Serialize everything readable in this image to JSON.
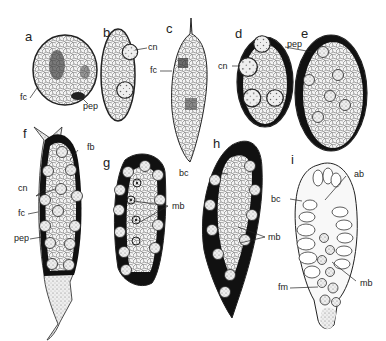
{
  "figure": {
    "panels": [
      {
        "id": "a",
        "label": "a",
        "annotations": [
          {
            "text": "fc"
          },
          {
            "text": "pep"
          }
        ]
      },
      {
        "id": "b",
        "label": "b",
        "annotations": [
          {
            "text": "cn"
          }
        ]
      },
      {
        "id": "c",
        "label": "c",
        "annotations": [
          {
            "text": "fc"
          }
        ]
      },
      {
        "id": "d",
        "label": "d",
        "annotations": [
          {
            "text": "pep"
          },
          {
            "text": "cn"
          }
        ]
      },
      {
        "id": "e",
        "label": "e",
        "annotations": []
      },
      {
        "id": "f",
        "label": "f",
        "annotations": [
          {
            "text": "fb"
          },
          {
            "text": "cn"
          },
          {
            "text": "fc"
          },
          {
            "text": "pep"
          }
        ]
      },
      {
        "id": "g",
        "label": "g",
        "annotations": [
          {
            "text": "mb"
          }
        ]
      },
      {
        "id": "h",
        "label": "h",
        "annotations": [
          {
            "text": "bc"
          },
          {
            "text": "mb"
          }
        ]
      },
      {
        "id": "i",
        "label": "i",
        "annotations": [
          {
            "text": "bc"
          },
          {
            "text": "ab"
          },
          {
            "text": "mb"
          },
          {
            "text": "fm"
          }
        ]
      }
    ]
  }
}
